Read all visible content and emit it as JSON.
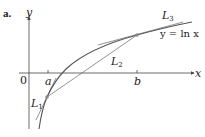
{
  "figure": {
    "panel_label": "a.",
    "function_label": "y = ln x",
    "axes": {
      "x_label": "x",
      "y_label": "y",
      "origin_label": "0"
    },
    "ticks": [
      {
        "label": "a"
      },
      {
        "label": "b"
      }
    ],
    "lines": [
      {
        "name": "L",
        "sub": "1",
        "description": "tangent line at x = a"
      },
      {
        "name": "L",
        "sub": "2",
        "description": "secant line through (a, ln a) and (b, ln b)"
      },
      {
        "name": "L",
        "sub": "3",
        "description": "tangent line at x = b"
      }
    ],
    "colors": {
      "curve": "#555555",
      "axis": "#444444",
      "point": "#888888",
      "text": "#222222"
    }
  }
}
